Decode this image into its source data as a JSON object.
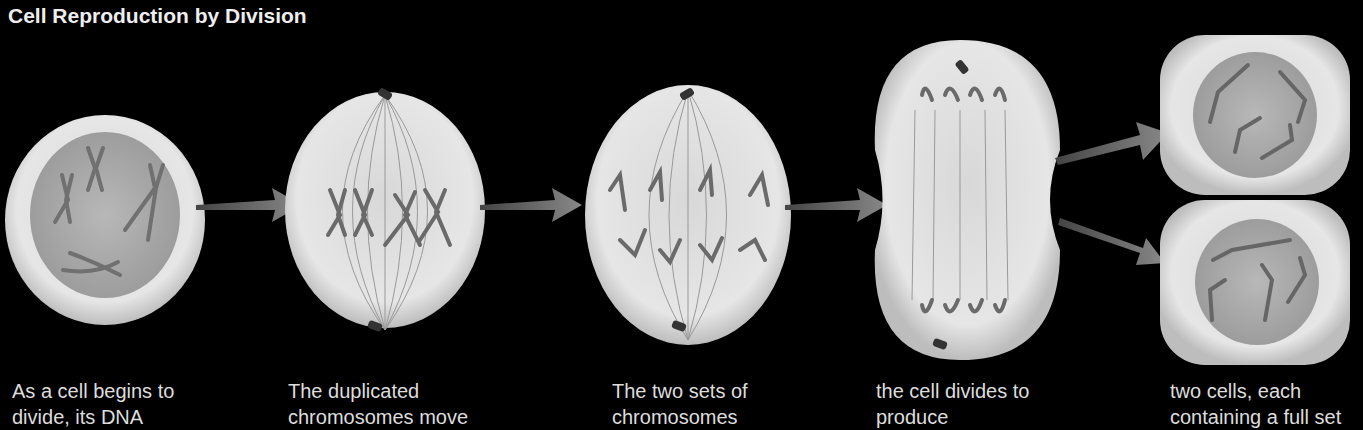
{
  "title": "Cell Reproduction by Division",
  "stages": [
    {
      "caption_line1": "As a cell begins to",
      "caption_line2": "divide, its DNA"
    },
    {
      "caption_line1": "The duplicated",
      "caption_line2": "chromosomes move"
    },
    {
      "caption_line1": "The two sets of",
      "caption_line2": "chromosomes"
    },
    {
      "caption_line1": "the cell divides to",
      "caption_line2": "produce"
    },
    {
      "caption_line1": "two cells, each",
      "caption_line2": "containing a full set"
    }
  ],
  "colors": {
    "background": "#000000",
    "cytoplasm": "#e8e8e8",
    "nucleus": "#a8a8a8",
    "chromosome": "#6a6a6a",
    "arrow": "#7a7a7a",
    "text": "#dddddd"
  }
}
